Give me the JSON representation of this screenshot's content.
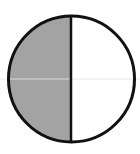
{
  "diagram": {
    "type": "fraction-circle",
    "parts_total": 2,
    "parts_shaded": 1,
    "shaded_side": "left",
    "colors": {
      "shaded_fill": "#a3a3a3",
      "unshaded_fill": "#ffffff",
      "outline": "#111111",
      "guide_line": "#e4e4e4"
    }
  }
}
